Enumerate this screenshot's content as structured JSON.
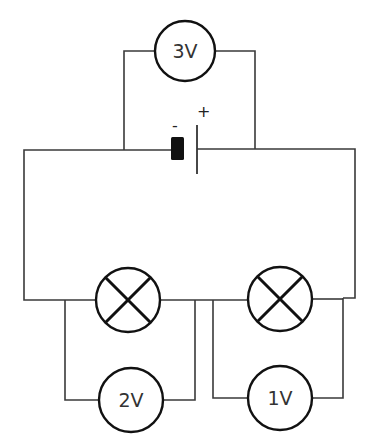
{
  "diagram": {
    "type": "circuit",
    "colors": {
      "wire": "#3a3a3a",
      "symbol": "#111111",
      "background": "#ffffff"
    },
    "battery": {
      "negative_label": "-",
      "positive_label": "+"
    },
    "voltmeters": [
      {
        "id": "vm-top",
        "label": "3V",
        "across": "battery"
      },
      {
        "id": "vm-left",
        "label": "2V",
        "across": "lamp-left"
      },
      {
        "id": "vm-right",
        "label": "1V",
        "across": "lamp-right"
      }
    ],
    "lamps": [
      {
        "id": "lamp-left"
      },
      {
        "id": "lamp-right"
      }
    ]
  }
}
